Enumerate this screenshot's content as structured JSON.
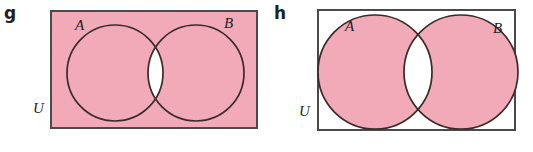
{
  "figure": {
    "caption_parts": [
      "g",
      "h"
    ],
    "colors": {
      "shaded_fill": "#f2a9b7",
      "unshaded_fill": "#ffffff",
      "stroke": "#3a2b2b",
      "rect_stroke": "#4a4a4a",
      "label_color": "#231f20",
      "page_background": "#ffffff"
    }
  },
  "panels": [
    {
      "id": "g",
      "part_label": "g",
      "universe_label": "U",
      "set_a_label": "A",
      "set_b_label": "B",
      "universe_shaded": true,
      "intersection_shaded": false,
      "circles_shaded": true,
      "description": "Rectangle U entirely shaded except the lens-shaped intersection of circles A and B, which is left white.",
      "geometry": {
        "rect": {
          "x": 21,
          "y": 11,
          "width": 206,
          "height": 117
        },
        "circle_a": {
          "cx": 85,
          "cy": 73,
          "r": 48
        },
        "circle_b": {
          "cx": 166,
          "cy": 73,
          "r": 48
        }
      }
    },
    {
      "id": "h",
      "part_label": "h",
      "universe_label": "U",
      "set_a_label": "A",
      "set_b_label": "B",
      "universe_shaded": false,
      "intersection_shaded": false,
      "circles_shaded": true,
      "description": "Rectangle U unshaded; circles A and B shaded except their lens-shaped intersection, which is left white.",
      "geometry": {
        "rect": {
          "x": 22,
          "y": 10,
          "width": 197,
          "height": 120
        },
        "circle_a": {
          "cx": 79,
          "cy": 72,
          "r": 57
        },
        "circle_b": {
          "cx": 165,
          "cy": 72,
          "r": 57
        }
      }
    }
  ]
}
